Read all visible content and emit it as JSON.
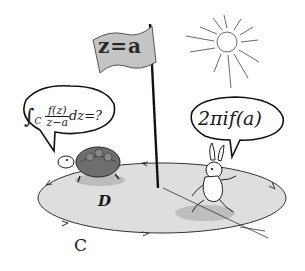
{
  "illustration": {
    "subject": "Cauchy integral formula cartoon",
    "flag": {
      "text": "z=a"
    },
    "turtle_speech": {
      "integral_symbol": "∫",
      "contour": "C",
      "numerator": "f(z)",
      "denominator": "z−a",
      "tail": "dz=?"
    },
    "rabbit_speech": {
      "text": "2πif(a)"
    },
    "region_label": "D",
    "contour_label": "C",
    "start_goal_label": "スタート ゴール",
    "colors": {
      "ink": "#1a1a1a",
      "ground": "#d9d9d9",
      "flag": "#bdbdbd",
      "shell": "#6e6e6e"
    }
  }
}
